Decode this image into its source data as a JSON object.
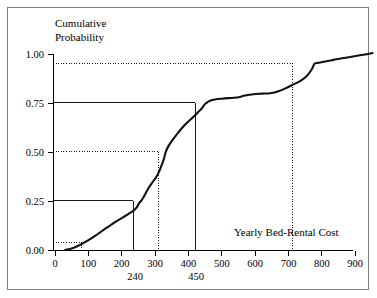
{
  "figure": {
    "background_color": "#ffffff",
    "frame_color": "#808080",
    "curve_color": "#111111"
  },
  "chart_data": {
    "type": "line",
    "title": "",
    "subtitle": "",
    "xlabel": "Yearly Bed-Rental Cost",
    "ylabel": "Cumulative Probability",
    "ylabel_line1": "Cumulative",
    "ylabel_line2": "Probability",
    "xlim": [
      0,
      960
    ],
    "ylim": [
      0.0,
      1.02
    ],
    "grid": false,
    "legend": null,
    "xticks": [
      0,
      100,
      200,
      300,
      400,
      500,
      600,
      700,
      800,
      900
    ],
    "xticklabels": [
      "0",
      "100",
      "200",
      "300",
      "400",
      "500",
      "600",
      "700",
      "800",
      "900"
    ],
    "yticks": [
      0.0,
      0.25,
      0.5,
      0.75,
      1.0
    ],
    "yticklabels": [
      "0.00",
      "0.25",
      "0.50",
      "0.75",
      "1.00"
    ],
    "series": [
      {
        "name": "Empirical cumulative distribution",
        "x": [
          30,
          45,
          60,
          75,
          90,
          105,
          120,
          135,
          150,
          165,
          180,
          195,
          205,
          215,
          225,
          235,
          245,
          252,
          258,
          265,
          272,
          280,
          288,
          295,
          302,
          310,
          318,
          326,
          332,
          340,
          350,
          360,
          370,
          382,
          395,
          408,
          420,
          430,
          440,
          448,
          455,
          465,
          480,
          500,
          520,
          545,
          570,
          595,
          620,
          645,
          670,
          695,
          715,
          735,
          755,
          770,
          778,
          790,
          810,
          835,
          860,
          885,
          910,
          935,
          952
        ],
        "y": [
          0.0,
          0.005,
          0.014,
          0.026,
          0.04,
          0.055,
          0.072,
          0.09,
          0.108,
          0.125,
          0.142,
          0.158,
          0.168,
          0.178,
          0.19,
          0.2,
          0.218,
          0.238,
          0.25,
          0.268,
          0.29,
          0.315,
          0.335,
          0.352,
          0.368,
          0.392,
          0.425,
          0.462,
          0.5,
          0.53,
          0.555,
          0.578,
          0.6,
          0.625,
          0.648,
          0.668,
          0.688,
          0.705,
          0.722,
          0.742,
          0.752,
          0.762,
          0.768,
          0.772,
          0.775,
          0.778,
          0.788,
          0.795,
          0.798,
          0.8,
          0.81,
          0.828,
          0.845,
          0.862,
          0.888,
          0.922,
          0.95,
          0.955,
          0.962,
          0.97,
          0.978,
          0.985,
          0.992,
          0.999,
          1.005
        ]
      }
    ],
    "annotations": [
      {
        "label": "240",
        "x": 240,
        "style": "x-axis-callout"
      },
      {
        "label": "450",
        "x": 450,
        "style": "x-axis-callout"
      }
    ],
    "reference_lines": [
      {
        "y": 0.25,
        "x": 250,
        "style": "solid",
        "label": "240"
      },
      {
        "y": 0.5,
        "x": 330,
        "style": "dotted",
        "label": ""
      },
      {
        "y": 0.75,
        "x": 450,
        "style": "solid",
        "label": "450"
      },
      {
        "y": 0.95,
        "x": 775,
        "style": "dotted",
        "label": ""
      },
      {
        "y": 0.04,
        "x": 90,
        "style": "dotted",
        "label": ""
      }
    ]
  }
}
